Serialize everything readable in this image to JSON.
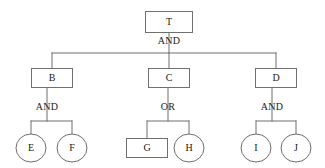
{
  "diagram": {
    "type": "fault-tree",
    "title": "",
    "colors": {
      "stroke": "#6f6f6f",
      "text": "#1a1a1a",
      "background": "#ffffff"
    },
    "nodes": [
      {
        "id": "T",
        "label": "T",
        "shape": "rect",
        "cx": 169,
        "cy": 22,
        "w": 47,
        "h": 21
      },
      {
        "id": "B",
        "label": "B",
        "shape": "rect",
        "cx": 52,
        "cy": 78,
        "w": 41,
        "h": 19
      },
      {
        "id": "C",
        "label": "C",
        "shape": "rect",
        "cx": 169,
        "cy": 78,
        "w": 41,
        "h": 19
      },
      {
        "id": "D",
        "label": "D",
        "shape": "rect",
        "cx": 276,
        "cy": 78,
        "w": 41,
        "h": 19
      },
      {
        "id": "E",
        "label": "E",
        "shape": "ellipse",
        "cx": 31,
        "cy": 148,
        "w": 30,
        "h": 28
      },
      {
        "id": "F",
        "label": "F",
        "shape": "ellipse",
        "cx": 72,
        "cy": 148,
        "w": 30,
        "h": 28
      },
      {
        "id": "G",
        "label": "G",
        "shape": "rect",
        "cx": 147,
        "cy": 148,
        "w": 41,
        "h": 19
      },
      {
        "id": "H",
        "label": "H",
        "shape": "ellipse",
        "cx": 189,
        "cy": 148,
        "w": 30,
        "h": 28
      },
      {
        "id": "I",
        "label": "I",
        "shape": "ellipse",
        "cx": 256,
        "cy": 148,
        "w": 30,
        "h": 28
      },
      {
        "id": "J",
        "label": "J",
        "shape": "ellipse",
        "cx": 296,
        "cy": 148,
        "w": 30,
        "h": 28
      }
    ],
    "gates": [
      {
        "id": "gate-top",
        "label": "AND",
        "x": 169,
        "y": 42,
        "parent": "T",
        "children": [
          "B",
          "C",
          "D"
        ]
      },
      {
        "id": "gate-left",
        "label": "AND",
        "x": 47,
        "y": 108,
        "parent": "B",
        "children": [
          "E",
          "F"
        ]
      },
      {
        "id": "gate-middle",
        "label": "OR",
        "x": 168,
        "y": 108,
        "parent": "C",
        "children": [
          "G",
          "H"
        ]
      },
      {
        "id": "gate-right",
        "label": "AND",
        "x": 272,
        "y": 108,
        "parent": "D",
        "children": [
          "I",
          "J"
        ]
      }
    ],
    "connectors": [
      {
        "name": "top-trunk",
        "points": "169,33 169,53"
      },
      {
        "name": "top-bus",
        "points": "52,53 276,53"
      },
      {
        "name": "branch-to-b",
        "points": "52,53 52,68"
      },
      {
        "name": "branch-to-c",
        "points": "169,53 169,68"
      },
      {
        "name": "branch-to-d",
        "points": "276,53 276,68"
      },
      {
        "name": "left-trunk",
        "points": "47,88 47,121"
      },
      {
        "name": "left-bus",
        "points": "31,121 72,121"
      },
      {
        "name": "branch-to-e",
        "points": "31,121 31,134"
      },
      {
        "name": "branch-to-f",
        "points": "72,121 72,134"
      },
      {
        "name": "middle-trunk",
        "points": "168,88 168,121"
      },
      {
        "name": "middle-bus",
        "points": "147,121 189,121"
      },
      {
        "name": "branch-to-g",
        "points": "147,121 147,138"
      },
      {
        "name": "branch-to-h",
        "points": "189,121 189,134"
      },
      {
        "name": "right-trunk",
        "points": "272,88 272,121"
      },
      {
        "name": "right-bus",
        "points": "256,121 296,121"
      },
      {
        "name": "branch-to-i",
        "points": "256,121 256,134"
      },
      {
        "name": "branch-to-j",
        "points": "296,121 296,134"
      }
    ]
  }
}
